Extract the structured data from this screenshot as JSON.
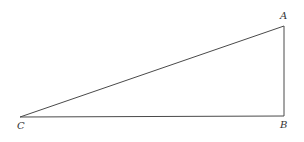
{
  "diagram": {
    "type": "right-triangle",
    "stroke_color": "#4a4a4a",
    "label_color": "#333333",
    "vertices": [
      {
        "id": "A",
        "label": "A",
        "x": 284,
        "y": 26,
        "label_x": 280,
        "label_y": 19
      },
      {
        "id": "B",
        "label": "B",
        "x": 284,
        "y": 116,
        "label_x": 280,
        "label_y": 128
      },
      {
        "id": "C",
        "label": "C",
        "x": 20,
        "y": 117,
        "label_x": 17,
        "label_y": 129
      }
    ],
    "edges": [
      {
        "from": "C",
        "to": "A"
      },
      {
        "from": "A",
        "to": "B"
      },
      {
        "from": "B",
        "to": "C"
      }
    ],
    "right_angle_at": "B"
  }
}
